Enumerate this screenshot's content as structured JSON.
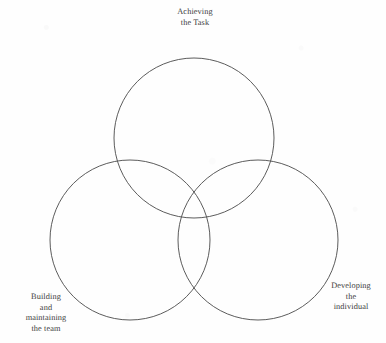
{
  "diagram": {
    "type": "venn",
    "circle_count": 3,
    "stroke_color": "#4a4a4a",
    "background_color": "#fefefe",
    "text_color": "#3d3d3d",
    "labels": {
      "top": "Achieving\nthe Task",
      "bottom_left": "Building\nand\nmaintaining\nthe team",
      "bottom_right": "Developing\nthe\nindividual"
    },
    "circles": [
      {
        "name": "achieving-the-task",
        "cx": 194,
        "cy": 138,
        "r": 80
      },
      {
        "name": "building-and-maintaining-the-team",
        "cx": 130,
        "cy": 240,
        "r": 80
      },
      {
        "name": "developing-the-individual",
        "cx": 258,
        "cy": 240,
        "r": 80
      }
    ]
  }
}
